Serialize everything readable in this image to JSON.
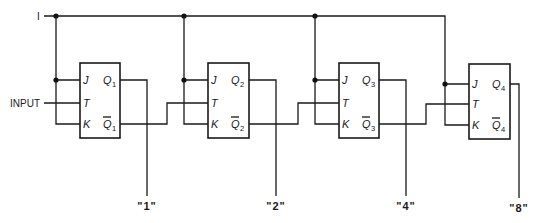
{
  "rail_label": "I",
  "input_label": "INPUT",
  "flipflops": [
    {
      "id": 1,
      "pins": {
        "j": "J",
        "t": "T",
        "k": "K"
      },
      "q": "Q",
      "qbar": "Q",
      "sub": "1",
      "output_label": "\"1\""
    },
    {
      "id": 2,
      "pins": {
        "j": "J",
        "t": "T",
        "k": "K"
      },
      "q": "Q",
      "qbar": "Q",
      "sub": "2",
      "output_label": "\"2\""
    },
    {
      "id": 3,
      "pins": {
        "j": "J",
        "t": "T",
        "k": "K"
      },
      "q": "Q",
      "qbar": "Q",
      "sub": "3",
      "output_label": "\"4\""
    },
    {
      "id": 4,
      "pins": {
        "j": "J",
        "t": "T",
        "k": "K"
      },
      "q": "Q",
      "qbar": "Q",
      "sub": "4",
      "output_label": "\"8\""
    }
  ],
  "colors": {
    "line": "#1a1a1a",
    "background": "#ffffff"
  }
}
